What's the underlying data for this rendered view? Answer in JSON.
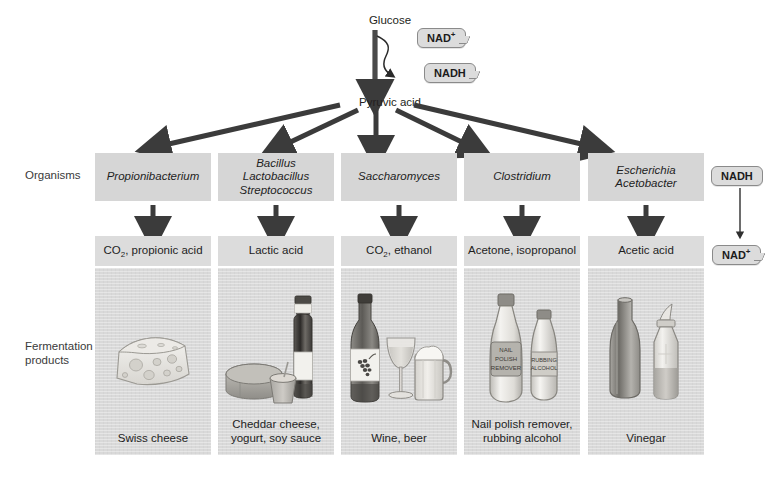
{
  "pathway": {
    "glucose_label": "Glucose",
    "pyruvic_label": "Pyruvic acid",
    "nad_plus_label": "NAD",
    "nad_plus_sup": "+",
    "nadh_label": "NADH"
  },
  "row_labels": {
    "organisms": "Organisms",
    "fermentation_products": "Fermentation\nproducts",
    "organisms_line1": "Organisms",
    "products_line1": "Fermentation",
    "products_line2": "products"
  },
  "side_cycle": {
    "nadh_label": "NADH",
    "nad_plus_label": "NAD",
    "nad_plus_sup": "+"
  },
  "columns": [
    {
      "organisms": [
        "Propionibacterium"
      ],
      "products": "CO2, propionic acid",
      "products_pre": "CO",
      "products_sub": "2",
      "products_post": ", propionic acid",
      "caption": [
        "Swiss cheese"
      ],
      "illustration": "swiss-cheese-wedge"
    },
    {
      "organisms": [
        "Bacillus",
        "Lactobacillus",
        "Streptococcus"
      ],
      "products": "Lactic acid",
      "products_pre": "Lactic acid",
      "products_sub": "",
      "products_post": "",
      "caption": [
        "Cheddar cheese,",
        "yogurt, soy sauce"
      ],
      "illustration": "cheese-wheel-yogurt-soysauce-bottle"
    },
    {
      "organisms": [
        "Saccharomyces"
      ],
      "products": "CO2, ethanol",
      "products_pre": "CO",
      "products_sub": "2",
      "products_post": ", ethanol",
      "caption": [
        "Wine, beer"
      ],
      "illustration": "wine-bottle-glass-beer-mug"
    },
    {
      "organisms": [
        "Clostridium"
      ],
      "products": "Acetone, isopropanol",
      "products_pre": "Acetone, isopropanol",
      "products_sub": "",
      "products_post": "",
      "caption": [
        "Nail polish remover,",
        "rubbing alcohol"
      ],
      "illustration": "nail-polish-remover-rubbing-alcohol-bottles",
      "bottle_labels": {
        "left": [
          "NAIL",
          "POLISH",
          "REMOVER"
        ],
        "right": [
          "RUBBING",
          "ALCOHOL"
        ]
      }
    },
    {
      "organisms": [
        "Escherichia",
        "Acetobacter"
      ],
      "products": "Acetic acid",
      "products_pre": "Acetic acid",
      "products_sub": "",
      "products_post": "",
      "caption": [
        "Vinegar"
      ],
      "illustration": "vinegar-bottle-and-cruet"
    }
  ],
  "colors": {
    "arrow": "#3b3b3b",
    "box_fill": "#d6d6d6",
    "panel_fill": "#d9d9d9",
    "tag_fill": "#dcdcdc",
    "tag_stroke": "#8a8a8a",
    "text": "#231f20",
    "background": "#ffffff"
  }
}
